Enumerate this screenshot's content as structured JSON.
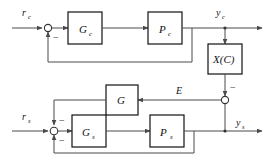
{
  "diagram": {
    "type": "control-block-diagram",
    "colors": {
      "wire": "#4a4a4a",
      "block_border": "#111111",
      "text": "#111111",
      "background": "#ffffff"
    },
    "blocks": [
      {
        "id": "Gc",
        "base": "G",
        "sub": "c",
        "loop": "upper",
        "role": "controller"
      },
      {
        "id": "Pc",
        "base": "P",
        "sub": "c",
        "loop": "upper",
        "role": "plant"
      },
      {
        "id": "XC",
        "base": "X(C)",
        "sub": "",
        "loop": "coupling",
        "role": "coupling"
      },
      {
        "id": "G",
        "base": "G",
        "sub": "",
        "loop": "cross",
        "role": "cross-feedback"
      },
      {
        "id": "Gs",
        "base": "G",
        "sub": "s",
        "loop": "lower",
        "role": "controller"
      },
      {
        "id": "Ps",
        "base": "P",
        "sub": "s",
        "loop": "lower",
        "role": "plant"
      }
    ],
    "signals": [
      {
        "id": "rc",
        "base": "r",
        "sub": "c",
        "kind": "input",
        "loop": "upper"
      },
      {
        "id": "yc",
        "base": "y",
        "sub": "c",
        "kind": "output",
        "loop": "upper"
      },
      {
        "id": "rs",
        "base": "r",
        "sub": "s",
        "kind": "input",
        "loop": "lower"
      },
      {
        "id": "ys",
        "base": "y",
        "sub": "s",
        "kind": "output",
        "loop": "lower"
      },
      {
        "id": "E",
        "base": "E",
        "sub": "",
        "kind": "internal",
        "loop": "cross"
      }
    ],
    "summing_junctions": [
      {
        "id": "sum-upper",
        "signs": [
          "-"
        ]
      },
      {
        "id": "sum-lower",
        "signs": [
          "-",
          "-"
        ]
      },
      {
        "id": "sum-right",
        "signs": [
          "-"
        ]
      }
    ],
    "signs": {
      "minus": "−"
    }
  }
}
